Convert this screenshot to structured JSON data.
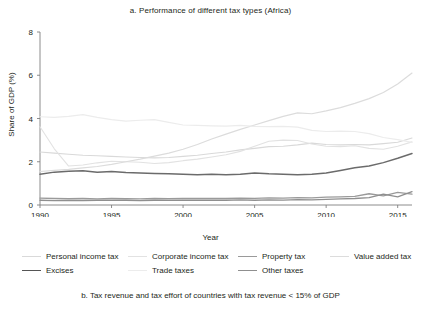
{
  "chart_data": {
    "type": "line",
    "title": "a. Performance of different tax types (Africa)",
    "xlabel": "Year",
    "ylabel": "Share of GDP (%)",
    "xlim": [
      1990,
      2016
    ],
    "ylim": [
      0,
      8
    ],
    "xticks": [
      1990,
      1995,
      2000,
      2005,
      2010,
      2015
    ],
    "yticks": [
      0,
      2,
      4,
      6,
      8
    ],
    "grid": false,
    "legend_position": "bottom",
    "x": [
      1990,
      1991,
      1992,
      1993,
      1994,
      1995,
      1996,
      1997,
      1998,
      1999,
      2000,
      2001,
      2002,
      2003,
      2004,
      2005,
      2006,
      2007,
      2008,
      2009,
      2010,
      2011,
      2012,
      2013,
      2014,
      2015,
      2016
    ],
    "series": [
      {
        "name": "Personal income tax",
        "color": "#d9d9d9",
        "width": 1.1,
        "values": [
          2.45,
          2.4,
          2.35,
          2.3,
          2.28,
          2.25,
          2.22,
          2.2,
          2.18,
          2.2,
          2.25,
          2.3,
          2.38,
          2.45,
          2.55,
          2.62,
          2.7,
          2.72,
          2.78,
          2.86,
          2.8,
          2.78,
          2.8,
          2.78,
          2.84,
          2.9,
          3.1
        ]
      },
      {
        "name": "Corporate income tax",
        "color": "#e2e2e2",
        "width": 1.1,
        "values": [
          3.62,
          2.6,
          1.8,
          1.85,
          1.95,
          2.02,
          2.0,
          1.98,
          1.92,
          1.96,
          2.05,
          2.12,
          2.22,
          2.32,
          2.48,
          2.72,
          2.95,
          3.0,
          2.98,
          2.82,
          2.72,
          2.7,
          2.74,
          2.62,
          2.58,
          2.72,
          2.92
        ]
      },
      {
        "name": "Property tax",
        "color": "#9a9a9a",
        "width": 1.3,
        "values": [
          0.32,
          0.3,
          0.29,
          0.3,
          0.28,
          0.3,
          0.29,
          0.28,
          0.3,
          0.29,
          0.3,
          0.3,
          0.31,
          0.3,
          0.32,
          0.31,
          0.33,
          0.32,
          0.34,
          0.33,
          0.36,
          0.38,
          0.4,
          0.52,
          0.42,
          0.58,
          0.5
        ]
      },
      {
        "name": "Value added tax",
        "color": "#dcdcdc",
        "width": 1.2,
        "values": [
          1.55,
          1.6,
          1.65,
          1.72,
          1.78,
          1.88,
          2.0,
          2.12,
          2.26,
          2.4,
          2.58,
          2.8,
          3.05,
          3.28,
          3.5,
          3.7,
          3.9,
          4.1,
          4.26,
          4.22,
          4.35,
          4.5,
          4.7,
          4.92,
          5.2,
          5.6,
          6.1
        ]
      },
      {
        "name": "Excises",
        "color": "#6b6b6b",
        "width": 1.5,
        "values": [
          1.42,
          1.52,
          1.56,
          1.58,
          1.52,
          1.55,
          1.5,
          1.48,
          1.46,
          1.44,
          1.42,
          1.4,
          1.42,
          1.4,
          1.42,
          1.48,
          1.44,
          1.42,
          1.4,
          1.42,
          1.48,
          1.6,
          1.72,
          1.8,
          1.96,
          2.16,
          2.38
        ]
      },
      {
        "name": "Trade taxes",
        "color": "#ececec",
        "width": 1.2,
        "values": [
          4.08,
          4.05,
          4.1,
          4.18,
          4.05,
          3.95,
          3.88,
          3.92,
          3.95,
          3.82,
          3.7,
          3.68,
          3.66,
          3.65,
          3.68,
          3.64,
          3.62,
          3.64,
          3.6,
          3.45,
          3.4,
          3.42,
          3.4,
          3.3,
          3.12,
          3.02,
          2.9
        ]
      },
      {
        "name": "Other taxes",
        "color": "#8f8f8f",
        "width": 1.3,
        "values": [
          0.22,
          0.2,
          0.21,
          0.2,
          0.22,
          0.21,
          0.22,
          0.2,
          0.22,
          0.21,
          0.22,
          0.22,
          0.23,
          0.22,
          0.24,
          0.22,
          0.24,
          0.23,
          0.25,
          0.24,
          0.26,
          0.28,
          0.3,
          0.34,
          0.5,
          0.38,
          0.62
        ]
      }
    ]
  },
  "legend": {
    "items": [
      {
        "label": "Personal income tax",
        "color": "#d9d9d9",
        "width": 1.1,
        "col": 0,
        "row": 0
      },
      {
        "label": "Corporate income tax",
        "color": "#e2e2e2",
        "width": 1.1,
        "col": 1,
        "row": 0
      },
      {
        "label": "Property tax",
        "color": "#9a9a9a",
        "width": 1.4,
        "col": 2,
        "row": 0
      },
      {
        "label": "Value added tax",
        "color": "#dcdcdc",
        "width": 1.2,
        "col": 3,
        "row": 0
      },
      {
        "label": "Excises",
        "color": "#555555",
        "width": 1.6,
        "col": 0,
        "row": 1
      },
      {
        "label": "Trade taxes",
        "color": "#ececec",
        "width": 1.2,
        "col": 1,
        "row": 1
      },
      {
        "label": "Other taxes",
        "color": "#8f8f8f",
        "width": 1.4,
        "col": 2,
        "row": 1
      }
    ]
  },
  "caption": "b. Tax revenue and tax effort of countries with tax revenue < 15% of GDP"
}
